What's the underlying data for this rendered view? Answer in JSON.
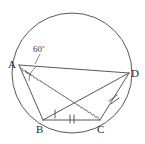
{
  "figure": {
    "background_color": "#ffffff",
    "stroke_color": "#585858",
    "label_color": "#2b2b2b",
    "circle": {
      "center_x": 72,
      "center_y": 73,
      "radius": 60
    },
    "points": {
      "A": {
        "label": "A",
        "x": 19,
        "y": 65,
        "label_x": 8,
        "label_y": 68
      },
      "B": {
        "label": "B",
        "x": 43,
        "y": 120,
        "label_x": 36,
        "label_y": 133
      },
      "C": {
        "label": "C",
        "x": 100,
        "y": 120,
        "label_x": 98,
        "label_y": 133
      },
      "D": {
        "label": "D",
        "x": 129,
        "y": 73,
        "label_x": 131,
        "label_y": 77
      }
    },
    "angle": {
      "vertex": "A",
      "value": "60",
      "degree_symbol": "˚",
      "text": "60˚",
      "label_x": 33,
      "label_y": 52,
      "arc_radius": 16
    },
    "segments": [
      {
        "name": "AD",
        "from": "A",
        "to": "D",
        "style": "solid"
      },
      {
        "name": "AB",
        "from": "A",
        "to": "B",
        "style": "solid"
      },
      {
        "name": "BC",
        "from": "B",
        "to": "C",
        "style": "solid"
      },
      {
        "name": "CD",
        "from": "C",
        "to": "D",
        "style": "solid"
      },
      {
        "name": "BD",
        "from": "B",
        "to": "D",
        "style": "solid"
      },
      {
        "name": "AC",
        "from": "A",
        "to": "C",
        "style": "dashed"
      },
      {
        "name": "BD-dashed",
        "from": "A",
        "to": "C",
        "style": "dashed"
      }
    ],
    "tick_marks": [
      {
        "name": "tick-BC",
        "segment": "BC",
        "count": 2,
        "x": 72,
        "y": 118
      },
      {
        "name": "tick-CD",
        "segment": "CD",
        "count": 2,
        "x": 113,
        "y": 97
      },
      {
        "name": "tick-BX",
        "segment": "B-interior",
        "count": 1,
        "x": 57,
        "y": 114
      }
    ]
  }
}
